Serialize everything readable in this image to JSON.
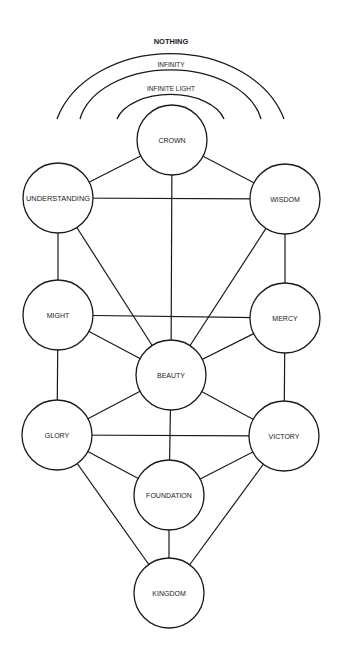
{
  "diagram": {
    "type": "tree-of-life",
    "arcs": [
      {
        "id": "nothing",
        "label": "NOTHING"
      },
      {
        "id": "infinity",
        "label": "INFINITY"
      },
      {
        "id": "infinite_light",
        "label": "INFINITE LIGHT"
      }
    ],
    "nodes": {
      "crown": {
        "label": "CROWN"
      },
      "understanding": {
        "label": "UNDERSTANDING"
      },
      "wisdom": {
        "label": "WISDOM"
      },
      "might": {
        "label": "MIGHT"
      },
      "mercy": {
        "label": "MERCY"
      },
      "beauty": {
        "label": "BEAUTY"
      },
      "glory": {
        "label": "GLORY"
      },
      "victory": {
        "label": "VICTORY"
      },
      "foundation": {
        "label": "FOUNDATION"
      },
      "kingdom": {
        "label": "KINGDOM"
      }
    },
    "edges": [
      [
        "crown",
        "understanding"
      ],
      [
        "crown",
        "wisdom"
      ],
      [
        "crown",
        "beauty"
      ],
      [
        "understanding",
        "wisdom"
      ],
      [
        "understanding",
        "might"
      ],
      [
        "understanding",
        "beauty"
      ],
      [
        "wisdom",
        "mercy"
      ],
      [
        "wisdom",
        "beauty"
      ],
      [
        "might",
        "mercy"
      ],
      [
        "might",
        "beauty"
      ],
      [
        "might",
        "glory"
      ],
      [
        "mercy",
        "beauty"
      ],
      [
        "mercy",
        "victory"
      ],
      [
        "beauty",
        "glory"
      ],
      [
        "beauty",
        "victory"
      ],
      [
        "beauty",
        "foundation"
      ],
      [
        "glory",
        "victory"
      ],
      [
        "glory",
        "foundation"
      ],
      [
        "glory",
        "kingdom"
      ],
      [
        "victory",
        "foundation"
      ],
      [
        "victory",
        "kingdom"
      ],
      [
        "foundation",
        "kingdom"
      ]
    ],
    "colors": {
      "line": "#1a1a1a",
      "background": "#ffffff"
    }
  }
}
